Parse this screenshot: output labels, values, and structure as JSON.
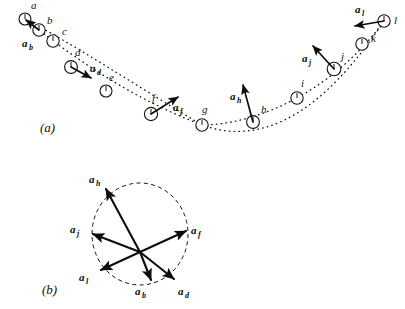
{
  "figure": {
    "panel_a_label": "(a)",
    "panel_b_label": "(b)"
  },
  "panel_a": {
    "description": "Dotted parabolic trajectory with twelve successive ball positions labelled a through l; acceleration vectors drawn at alternate positions",
    "points": [
      {
        "id": "a",
        "label": "a",
        "cx": 25,
        "cy": 19,
        "r": 6.0,
        "label_x": 31,
        "label_y": 9
      },
      {
        "id": "b",
        "label": "b",
        "cx": 39,
        "cy": 30,
        "r": 6.2,
        "label_x": 47,
        "label_y": 24
      },
      {
        "id": "c",
        "label": "c",
        "cx": 53,
        "cy": 41,
        "r": 6.2,
        "label_x": 62,
        "label_y": 35
      },
      {
        "id": "d",
        "label": "d",
        "cx": 71,
        "cy": 67,
        "r": 6.4,
        "label_x": 75,
        "label_y": 56
      },
      {
        "id": "e",
        "label": "e",
        "cx": 106,
        "cy": 91,
        "r": 6.0,
        "label_x": 109,
        "label_y": 81
      },
      {
        "id": "f",
        "label": "f",
        "cx": 151,
        "cy": 114,
        "r": 6.6,
        "label_x": 152,
        "label_y": 102
      },
      {
        "id": "g",
        "label": "g",
        "cx": 202,
        "cy": 125,
        "r": 6.2,
        "label_x": 202,
        "label_y": 113
      },
      {
        "id": "h",
        "label": "h",
        "cx": 253,
        "cy": 122,
        "r": 6.4,
        "label_x": 261,
        "label_y": 113
      },
      {
        "id": "i",
        "label": "i",
        "cx": 297,
        "cy": 98,
        "r": 6.2,
        "label_x": 301,
        "label_y": 87
      },
      {
        "id": "j",
        "label": "j",
        "cx": 334,
        "cy": 69,
        "r": 6.8,
        "label_x": 341,
        "label_y": 60
      },
      {
        "id": "k",
        "label": "k",
        "cx": 362,
        "cy": 44,
        "r": 6.2,
        "label_x": 371,
        "label_y": 42
      },
      {
        "id": "l",
        "label": "l",
        "cx": 384,
        "cy": 21,
        "r": 6.2,
        "label_x": 394,
        "label_y": 24
      }
    ],
    "vectors": [
      {
        "id": "a_b",
        "base": "a",
        "sub": "b",
        "x1": 39,
        "y1": 30,
        "x2": 25,
        "y2": 19,
        "label_x": 22,
        "label_y": 47
      },
      {
        "id": "a_d",
        "base": "a",
        "sub": "d",
        "x1": 71,
        "y1": 67,
        "x2": 91,
        "y2": 78,
        "label_x": 90,
        "label_y": 72
      },
      {
        "id": "a_f",
        "base": "a",
        "sub": "f",
        "x1": 151,
        "y1": 114,
        "x2": 178,
        "y2": 97,
        "label_x": 173,
        "label_y": 111
      },
      {
        "id": "a_h",
        "base": "a",
        "sub": "h",
        "x1": 253,
        "y1": 122,
        "x2": 243,
        "y2": 85,
        "label_x": 230,
        "label_y": 100
      },
      {
        "id": "a_j",
        "base": "a",
        "sub": "j",
        "x1": 334,
        "y1": 69,
        "x2": 313,
        "y2": 46,
        "label_x": 302,
        "label_y": 62
      },
      {
        "id": "a_l",
        "base": "a",
        "sub": "l",
        "x1": 384,
        "y1": 21,
        "x2": 355,
        "y2": 26,
        "label_x": 355,
        "label_y": 13
      }
    ]
  },
  "panel_b": {
    "description": "The six acceleration vectors redrawn from a common origin; their tips lie on a dashed circle of constant magnitude",
    "origin": {
      "x": 140,
      "y": 252
    },
    "circle": {
      "cx": 140,
      "cy": 234,
      "rx": 48,
      "ry": 51
    },
    "vectors": [
      {
        "id": "a_h",
        "base": "a",
        "sub": "h",
        "x2": 106,
        "y2": 189,
        "label_x": 89,
        "label_y": 183
      },
      {
        "id": "a_f",
        "base": "a",
        "sub": "f",
        "x2": 186,
        "y2": 231,
        "label_x": 191,
        "label_y": 234
      },
      {
        "id": "a_j",
        "base": "a",
        "sub": "j",
        "x2": 93,
        "y2": 234,
        "label_x": 70,
        "label_y": 233
      },
      {
        "id": "a_l",
        "base": "a",
        "sub": "l",
        "x2": 101,
        "y2": 270,
        "label_x": 79,
        "label_y": 281
      },
      {
        "id": "a_b",
        "base": "a",
        "sub": "b",
        "x2": 151,
        "y2": 280,
        "label_x": 135,
        "label_y": 295
      },
      {
        "id": "a_d",
        "base": "a",
        "sub": "d",
        "x2": 174,
        "y2": 279,
        "label_x": 178,
        "label_y": 295
      }
    ]
  }
}
